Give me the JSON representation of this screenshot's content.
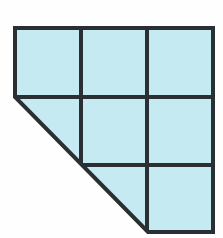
{
  "page": {
    "background_color": "#fefefe",
    "width": 223,
    "height": 238
  },
  "figure": {
    "name": "pentagon-grid-figure",
    "fill_color": "#c5eaf2",
    "line_color": "#2a2f33",
    "line_width": 4,
    "grid": {
      "columns": 3,
      "rows": 3,
      "left": 15,
      "top": 28,
      "right": 213,
      "bottom": 232,
      "vertical_gridlines": [
        81,
        147
      ],
      "horizontal_gridlines": [
        97,
        165
      ]
    },
    "outline_points": "15,28 213,28 213,232 148,232 15,97",
    "diagonal": {
      "from_x": 15,
      "from_y": 97,
      "to_x": 148,
      "to_y": 232
    },
    "full_squares_visible": 7
  },
  "ghost_text": {
    "color": "#bcd9e2",
    "note": "faint mirrored bleed-through from reverse side of page",
    "line_1": "Rectangles",
    "line_2": "4 2 squares",
    "line_3": "100"
  }
}
